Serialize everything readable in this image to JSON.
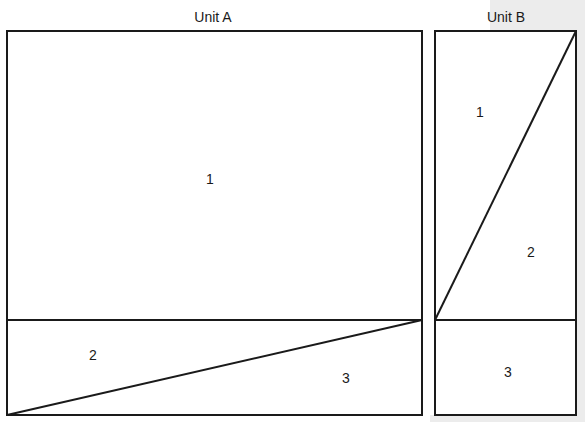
{
  "units": [
    {
      "title": "Unit A",
      "regions": [
        {
          "label": "1"
        },
        {
          "label": "2"
        },
        {
          "label": "3"
        }
      ]
    },
    {
      "title": "Unit B",
      "regions": [
        {
          "label": "1"
        },
        {
          "label": "2"
        },
        {
          "label": "3"
        }
      ]
    }
  ],
  "colors": {
    "line": "#1a1a1a",
    "background": "#ffffff",
    "shade": "#ececec"
  }
}
